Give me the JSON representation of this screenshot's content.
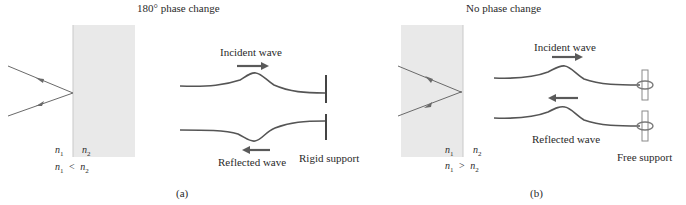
{
  "panel_a": {
    "title": "180° phase change",
    "n1_label": "n",
    "n1_sub": "1",
    "n2_label": "n",
    "n2_sub": "2",
    "relation_lhs": "n",
    "relation_lhs_sub": "1",
    "relation_op": "<",
    "relation_rhs": "n",
    "relation_rhs_sub": "2",
    "incident_label": "Incident wave",
    "reflected_label": "Reflected wave",
    "support_label": "Rigid support",
    "caption": "(a)"
  },
  "panel_b": {
    "title": "No phase change",
    "n1_label": "n",
    "n1_sub": "1",
    "n2_label": "n",
    "n2_sub": "2",
    "relation_lhs": "n",
    "relation_lhs_sub": "1",
    "relation_op": ">",
    "relation_rhs": "n",
    "relation_rhs_sub": "2",
    "incident_label": "Incident wave",
    "reflected_label": "Reflected wave",
    "support_label": "Free support",
    "caption": "(b)"
  },
  "colors": {
    "slab": "#e9e9e9",
    "ray": "#6a6a6a",
    "wave": "#555555",
    "arrow": "#5a5a5a",
    "support": "#444444",
    "ring_post": "#8a8a8a"
  }
}
